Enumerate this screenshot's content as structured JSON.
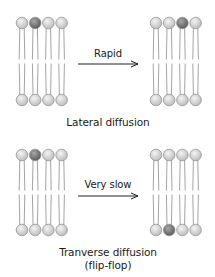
{
  "colors": {
    "head_light": "#d6d6d6",
    "head_dark": "#7a7a7a",
    "head_stroke": "#8c8c8c",
    "tail": "#9a9a9a",
    "arrow": "#222222",
    "text": "#1a1a1a"
  },
  "panels": [
    {
      "arrow_label": "Rapid",
      "caption": "Lateral diffusion",
      "caption_line2": "",
      "before": {
        "top_dark_index": 1,
        "bottom_dark_index": -1
      },
      "after": {
        "top_dark_index": 2,
        "bottom_dark_index": -1
      }
    },
    {
      "arrow_label": "Very slow",
      "caption": "Tranverse diffusion",
      "caption_line2": "(flip-flop)",
      "before": {
        "top_dark_index": 1,
        "bottom_dark_index": -1
      },
      "after": {
        "top_dark_index": -1,
        "bottom_dark_index": 1
      }
    }
  ]
}
